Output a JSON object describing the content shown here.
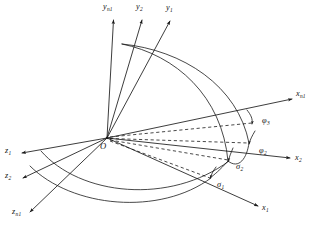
{
  "figure": {
    "origin_label": "O",
    "stroke_color": "#1a1a1a",
    "background_color": "#ffffff"
  },
  "axes": {
    "y_axes": [
      {
        "name": "y-axis-n1",
        "base": "y",
        "sub": "n1"
      },
      {
        "name": "y-axis-2",
        "base": "y",
        "sub": "2"
      },
      {
        "name": "y-axis-1",
        "base": "y",
        "sub": "1"
      }
    ],
    "x_axes": [
      {
        "name": "x-axis-n1",
        "base": "x",
        "sub": "n1"
      },
      {
        "name": "x-axis-2",
        "base": "x",
        "sub": "2"
      },
      {
        "name": "x-axis-1",
        "base": "x",
        "sub": "1"
      }
    ],
    "z_axes": [
      {
        "name": "z-axis-1",
        "base": "z",
        "sub": "1"
      },
      {
        "name": "z-axis-2",
        "base": "z",
        "sub": "2"
      },
      {
        "name": "z-axis-n1",
        "base": "z",
        "sub": "n1"
      }
    ]
  },
  "angle_labels": [
    {
      "name": "angle-phi-3",
      "symbol": "φ",
      "sub": "3"
    },
    {
      "name": "angle-phi-2",
      "symbol": "φ",
      "sub": "2"
    },
    {
      "name": "angle-sigma-2",
      "symbol": "σ",
      "sub": "2"
    },
    {
      "name": "angle-sigma-1",
      "symbol": "σ",
      "sub": "1"
    }
  ],
  "labels": {
    "y_n1": "y",
    "y_n1_sub": "n1",
    "y_2": "y",
    "y_2_sub": "2",
    "y_1": "y",
    "y_1_sub": "1",
    "x_n1": "x",
    "x_n1_sub": "n1",
    "x_2": "x",
    "x_2_sub": "2",
    "x_1": "x",
    "x_1_sub": "1",
    "z_1": "z",
    "z_1_sub": "1",
    "z_2": "z",
    "z_2_sub": "2",
    "z_n1": "z",
    "z_n1_sub": "n1",
    "origin": "O",
    "phi_3": "φ",
    "phi_3_sub": "3",
    "phi_2": "φ",
    "phi_2_sub": "2",
    "sigma_2": "σ",
    "sigma_2_sub": "2",
    "sigma_1": "σ",
    "sigma_1_sub": "1"
  }
}
